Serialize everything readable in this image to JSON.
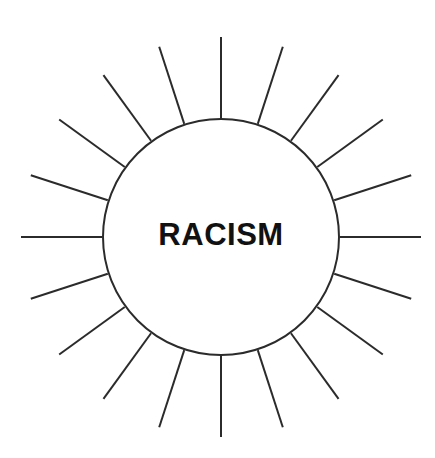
{
  "canvas": {
    "width": 435,
    "height": 458,
    "background_color": "#ffffff"
  },
  "diagram": {
    "type": "radial-burst-brainstorm",
    "title_text": "RACISM",
    "center": {
      "x": 221,
      "y": 237
    },
    "circle": {
      "radius": 118,
      "fill_color": "#ffffff",
      "stroke_color": "#2b2b2b",
      "stroke_width": 2
    },
    "label": {
      "text": "RACISM",
      "font_size_px": 31,
      "font_weight": "bold",
      "color": "#111111"
    },
    "rays": {
      "count": 20,
      "angle_step_degrees": 18,
      "start_angle_degrees": -90,
      "length_px": 82,
      "stroke_color": "#2b2b2b",
      "stroke_width": 2,
      "angles_degrees": [
        -90,
        -72,
        -54,
        -36,
        -18,
        0,
        18,
        36,
        54,
        72,
        90,
        108,
        126,
        144,
        162,
        180,
        198,
        216,
        234,
        252
      ]
    }
  }
}
